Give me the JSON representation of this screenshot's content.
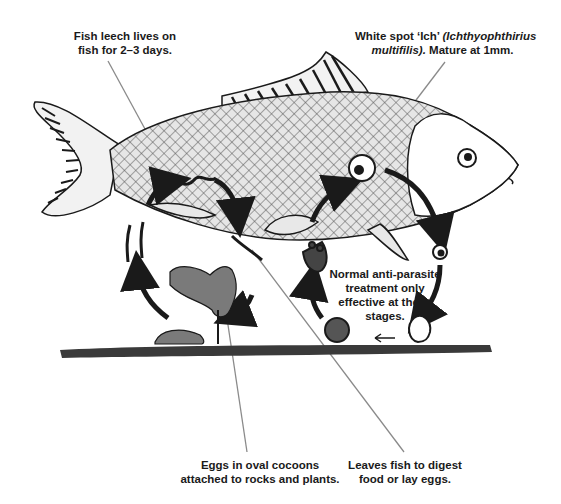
{
  "labels": {
    "leech": {
      "line1": "Fish leech lives on",
      "line2": "fish for 2–3 days."
    },
    "ich": {
      "line1_plain": "White spot ‘Ich’ ",
      "line1_italic": "(Ichthyophthirius",
      "line2_italic": "multifilis).",
      "line2_plain": " Mature at 1mm."
    },
    "treatment": {
      "line1": "Normal anti-parasite",
      "line2": "treatment only",
      "line3": "effective at these",
      "line4": "stages."
    },
    "eggs": {
      "line1": "Eggs in oval cocoons",
      "line2": "attached to rocks and plants."
    },
    "leaves": {
      "line1": "Leaves fish to digest",
      "line2": "food or lay eggs."
    }
  },
  "colors": {
    "ink": "#1a1a1a",
    "leader_line": "#8a8a8a",
    "fish_body": "#cfcfcf",
    "cocoon": "#7a7a7a",
    "ground": "#3a3a3a"
  }
}
